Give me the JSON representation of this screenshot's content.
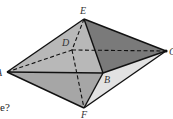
{
  "figure": {
    "type": "octahedron-like solid (two pyramids sharing base ABCD)",
    "vertices": {
      "E": {
        "label": "E",
        "x": 84,
        "y": 19
      },
      "D": {
        "label": "D",
        "x": 72,
        "y": 50
      },
      "C": {
        "label": "C",
        "x": 166,
        "y": 51
      },
      "A": {
        "label": "A",
        "x": 7,
        "y": 72
      },
      "B": {
        "label": "B",
        "x": 103,
        "y": 73
      },
      "F": {
        "label": "F",
        "x": 84,
        "y": 108
      }
    },
    "colors": {
      "face_front_left": "#b8b8b8",
      "face_front_right_top": "#7a7a7a",
      "face_bottom_left": "#a6a6a6",
      "face_bottom_right": "#e0e0e0",
      "edge": "#111111"
    }
  },
  "question_fragment": "e?"
}
